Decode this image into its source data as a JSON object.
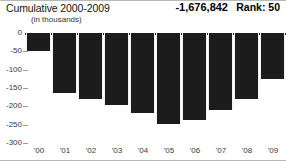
{
  "header": {
    "title": "Cumulative 2000-2009",
    "units": "(in thousands)",
    "total": "-1,676,842",
    "rank": "Rank: 50"
  },
  "chart_data": {
    "type": "bar",
    "title": "Cumulative 2000-2009",
    "subtitle": "(in thousands)",
    "xlabel": "",
    "ylabel": "",
    "categories": [
      "'00",
      "'01",
      "'02",
      "'03",
      "'04",
      "'05",
      "'06",
      "'07",
      "'08",
      "'09"
    ],
    "values": [
      -48,
      -163,
      -180,
      -196,
      -218,
      -248,
      -237,
      -210,
      -180,
      -125
    ],
    "ylim": [
      -300,
      0
    ],
    "yticks": [
      0,
      -50,
      -100,
      -150,
      -200,
      -250,
      -300
    ],
    "ytick_labels": [
      "0",
      "-50",
      "-100",
      "-150",
      "-200",
      "-250",
      "-300"
    ],
    "grid": false,
    "legend": null,
    "bar_color": "#1c1c1c",
    "annotations": {
      "total": "-1,676,842",
      "rank": "Rank: 50"
    }
  }
}
